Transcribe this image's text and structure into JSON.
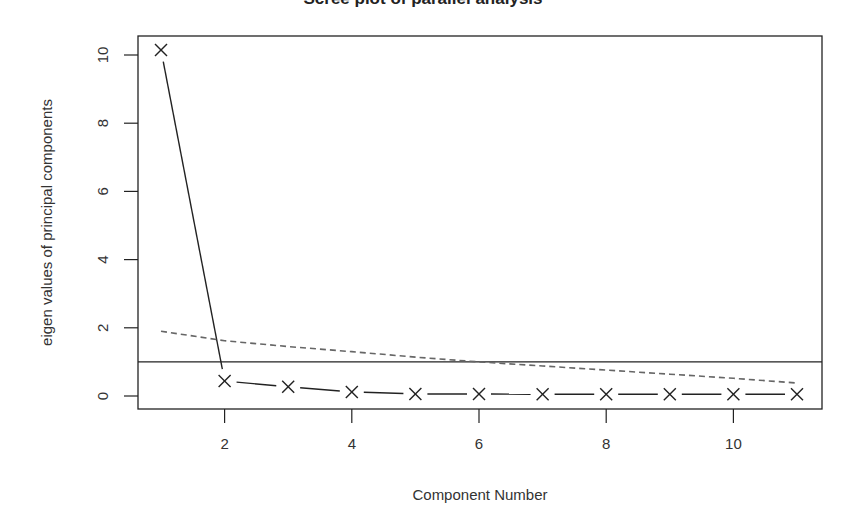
{
  "chart_data": {
    "type": "line",
    "title": "Scree plot of parallel analysis",
    "xlabel": "Component Number",
    "ylabel": "eigen values of principal components",
    "xlim": [
      0.6,
      11.4
    ],
    "ylim": [
      -0.4,
      10.6
    ],
    "x_ticks": [
      2,
      4,
      6,
      8,
      10
    ],
    "y_ticks": [
      0,
      2,
      4,
      6,
      8,
      10
    ],
    "grid": false,
    "legend": null,
    "series": [
      {
        "name": "Observed eigenvalues",
        "style": "solid line with x markers",
        "color": "#222222",
        "x": [
          1,
          2,
          3,
          4,
          5,
          6,
          7,
          8,
          9,
          10,
          11
        ],
        "values": [
          10.15,
          0.44,
          0.27,
          0.12,
          0.06,
          0.06,
          0.05,
          0.05,
          0.05,
          0.05,
          0.05
        ]
      },
      {
        "name": "Parallel analysis (random data)",
        "style": "dashed line",
        "color": "#666666",
        "x": [
          1,
          2,
          3,
          4,
          5,
          6,
          7,
          8,
          9,
          10,
          11
        ],
        "values": [
          1.9,
          1.62,
          1.45,
          1.3,
          1.14,
          1.0,
          0.88,
          0.76,
          0.64,
          0.52,
          0.38
        ]
      }
    ],
    "annotations": [
      {
        "type": "hline",
        "y": 1.0,
        "color": "#222222",
        "style": "solid"
      }
    ]
  }
}
